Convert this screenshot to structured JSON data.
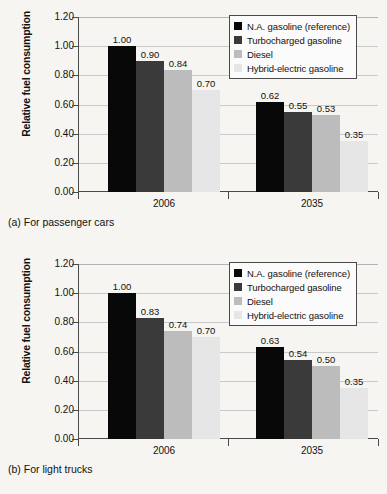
{
  "chart_data": [
    {
      "type": "bar",
      "id": "passenger-cars",
      "title": "",
      "caption": "(a) For passenger cars",
      "xlabel": "",
      "ylabel": "Relative fuel consumption",
      "categories": [
        "2006",
        "2035"
      ],
      "ylim": [
        0.0,
        1.2
      ],
      "yticks": [
        "0.00",
        "0.20",
        "0.40",
        "0.60",
        "0.80",
        "1.00",
        "1.20"
      ],
      "grid": true,
      "legend_position": "top-right",
      "series": [
        {
          "name": "N.A. gasoline (reference)",
          "color": "#080808",
          "values": [
            1.0,
            0.62
          ],
          "labels": [
            "1.00",
            "0.62"
          ]
        },
        {
          "name": "Turbocharged gasoline",
          "color": "#3a3a3a",
          "values": [
            0.9,
            0.55
          ],
          "labels": [
            "0.90",
            "0.55"
          ]
        },
        {
          "name": "Diesel",
          "color": "#bcbcbc",
          "values": [
            0.84,
            0.53
          ],
          "labels": [
            "0.84",
            "0.53"
          ]
        },
        {
          "name": "Hybrid-electric gasoline",
          "color": "#e6e6e6",
          "values": [
            0.7,
            0.35
          ],
          "labels": [
            "0.70",
            "0.35"
          ]
        }
      ]
    },
    {
      "type": "bar",
      "id": "light-trucks",
      "title": "",
      "caption": "(b) For light trucks",
      "xlabel": "",
      "ylabel": "Relative fuel consumption",
      "categories": [
        "2006",
        "2035"
      ],
      "ylim": [
        0.0,
        1.2
      ],
      "yticks": [
        "0.00",
        "0.20",
        "0.40",
        "0.60",
        "0.80",
        "1.00",
        "1.20"
      ],
      "grid": true,
      "legend_position": "top-right",
      "series": [
        {
          "name": "N.A. gasoline (reference)",
          "color": "#080808",
          "values": [
            1.0,
            0.63
          ],
          "labels": [
            "1.00",
            "0.63"
          ]
        },
        {
          "name": "Turbocharged gasoline",
          "color": "#3a3a3a",
          "values": [
            0.83,
            0.54
          ],
          "labels": [
            "0.83",
            "0.54"
          ]
        },
        {
          "name": "Diesel",
          "color": "#bcbcbc",
          "values": [
            0.74,
            0.5
          ],
          "labels": [
            "0.74",
            "0.50"
          ]
        },
        {
          "name": "Hybrid-electric gasoline",
          "color": "#e6e6e6",
          "values": [
            0.7,
            0.35
          ],
          "labels": [
            "0.70",
            "0.35"
          ]
        }
      ]
    }
  ]
}
